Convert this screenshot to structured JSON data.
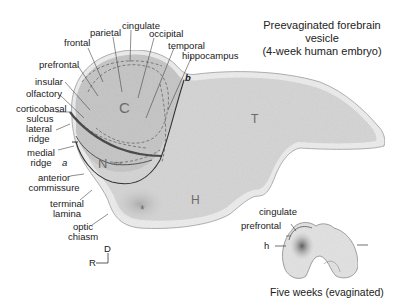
{
  "title": {
    "line1": "Preevaginated forebrain vesicle",
    "line2": "(4-week human embryo)"
  },
  "caption_inset": "Five weeks (evaginated)",
  "region_letters": {
    "C": "C",
    "N": "N",
    "T": "T",
    "H": "H",
    "star": "*",
    "sps": "sps"
  },
  "boundary_markers": {
    "a": "a",
    "b": "b"
  },
  "labels_left": [
    {
      "id": "prefrontal",
      "text": "prefrontal"
    },
    {
      "id": "insular",
      "text": "insular"
    },
    {
      "id": "olfactory",
      "text": "olfactory"
    },
    {
      "id": "corticobasal-sulcus",
      "text": "corticobasal\nsulcus"
    },
    {
      "id": "lateral-ridge",
      "text": "lateral\nridge"
    },
    {
      "id": "medial-ridge",
      "text": "medial\nridge"
    },
    {
      "id": "anterior-commissure",
      "text": "anterior\ncommissure"
    },
    {
      "id": "terminal-lamina",
      "text": "terminal\nlamina"
    },
    {
      "id": "optic-chiasm",
      "text": "optic\nchiasm"
    }
  ],
  "labels_top": [
    {
      "id": "frontal",
      "text": "frontal"
    },
    {
      "id": "parietal",
      "text": "parietal"
    },
    {
      "id": "cingulate",
      "text": "cingulate"
    },
    {
      "id": "occipital",
      "text": "occipital"
    },
    {
      "id": "temporal",
      "text": "temporal"
    },
    {
      "id": "hippocampus",
      "text": "hippocampus"
    }
  ],
  "inset_labels": [
    {
      "id": "cingulate",
      "text": "cingulate"
    },
    {
      "id": "prefrontal",
      "text": "prefrontal"
    },
    {
      "id": "h",
      "text": "h"
    }
  ],
  "orientation": {
    "dorsal": "D",
    "rostral": "R"
  },
  "colors": {
    "vesicle_fill": "#d4d4d4",
    "vesicle_rim": "#ececec",
    "cortex_fill": "#c6c6c6",
    "line_dark": "#3a3a3a",
    "text": "#1a1a1a",
    "region_letter": "#6a6a6a"
  }
}
